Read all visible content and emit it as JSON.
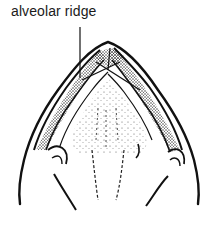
{
  "figure": {
    "label": "alveolar ridge",
    "colors": {
      "ink": "#111111",
      "background": "#ffffff",
      "stipple": "#333333"
    }
  }
}
